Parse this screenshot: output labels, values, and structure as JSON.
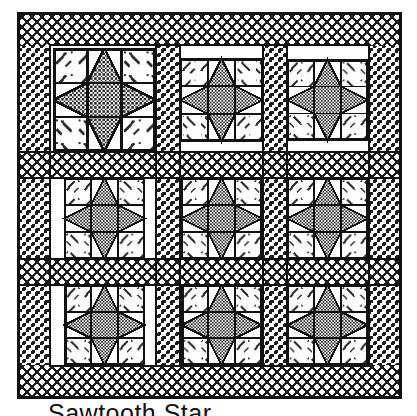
{
  "figure": {
    "caption": "Sawtooth Star",
    "title": "Sawtooth Star",
    "type": "quilt-block-diagram"
  },
  "quilt": {
    "block_name": "Sawtooth Star",
    "rows": 3,
    "columns": 3,
    "block_count": 9,
    "block_grid": "3x3",
    "has_sashing": true,
    "has_border": true,
    "units_per_block": 9,
    "unit_layout": [
      "corner",
      "flying-geese",
      "corner",
      "flying-geese",
      "center",
      "flying-geese",
      "corner",
      "flying-geese",
      "corner"
    ]
  },
  "colors": {
    "outline": "#000000",
    "background": "#ffffff",
    "light_fabric": "#ffffff",
    "medium_fabric": "#9a9a9a",
    "dark_fabric": "#1a1a1a",
    "border_fabric": "#bdbdbd",
    "sashing_fabric": "#cfcfcf",
    "center_fabric": "#a8a8a8"
  },
  "patterns": {
    "border_top_bottom": "cross-hatch",
    "border_sides": "checkerboard-dot",
    "sashing_horizontal": "cross-hatch",
    "sashing_vertical": "checkerboard-dot",
    "star_center": "fine-checkerboard",
    "star_points": "fine-checkerboard",
    "corner_squares": "speckled-white"
  },
  "geometry": {
    "quilt_x": 17,
    "quilt_y": 12,
    "quilt_width": 385,
    "quilt_height": 387
  }
}
